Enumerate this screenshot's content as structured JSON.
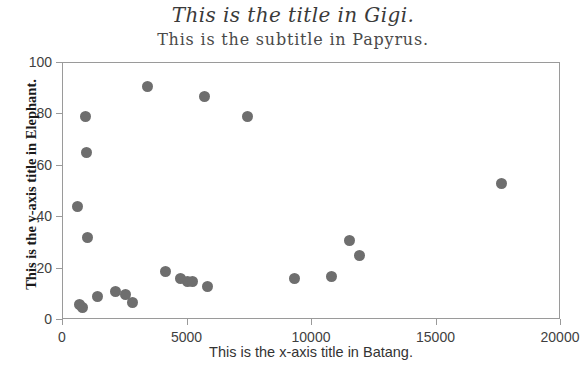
{
  "chart_data": {
    "type": "scatter",
    "title": "This is the title in Gigi.",
    "subtitle": "This is the subtitle in Papyrus.",
    "xlabel": "This is the x-axis title in Batang.",
    "ylabel": "This is the y-axis title in Elephant.",
    "xlim": [
      0,
      20000
    ],
    "ylim": [
      0,
      100
    ],
    "xticks": [
      0,
      5000,
      10000,
      15000,
      20000
    ],
    "yticks": [
      0,
      20,
      40,
      60,
      80,
      100
    ],
    "xtick_labels": [
      "0",
      "5000",
      "10000",
      "15000",
      "20000"
    ],
    "ytick_labels": [
      "0",
      "20",
      "40",
      "60",
      "80",
      "100"
    ],
    "grid": false,
    "legend": false,
    "marker_color": "#6e6e6e",
    "marker_size": 11,
    "frame_color": "#9a9a9a",
    "points": [
      {
        "x": 600,
        "y": 44
      },
      {
        "x": 650,
        "y": 6
      },
      {
        "x": 800,
        "y": 5
      },
      {
        "x": 900,
        "y": 79
      },
      {
        "x": 950,
        "y": 65
      },
      {
        "x": 1000,
        "y": 32
      },
      {
        "x": 1400,
        "y": 9
      },
      {
        "x": 2100,
        "y": 11
      },
      {
        "x": 2500,
        "y": 10
      },
      {
        "x": 2800,
        "y": 7
      },
      {
        "x": 3400,
        "y": 91
      },
      {
        "x": 4100,
        "y": 19
      },
      {
        "x": 4700,
        "y": 16
      },
      {
        "x": 5000,
        "y": 15
      },
      {
        "x": 5200,
        "y": 15
      },
      {
        "x": 5700,
        "y": 87
      },
      {
        "x": 5800,
        "y": 13
      },
      {
        "x": 7400,
        "y": 79
      },
      {
        "x": 9300,
        "y": 16
      },
      {
        "x": 10800,
        "y": 17
      },
      {
        "x": 11500,
        "y": 31
      },
      {
        "x": 11900,
        "y": 25
      },
      {
        "x": 17600,
        "y": 53
      }
    ]
  }
}
